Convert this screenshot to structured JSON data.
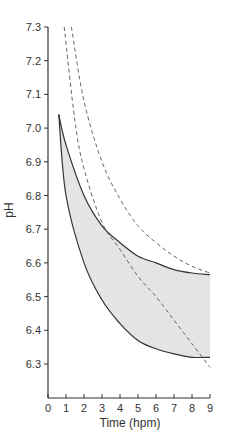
{
  "chart_data": {
    "type": "line",
    "title": "",
    "xlabel": "Time (hpm)",
    "ylabel": "pH",
    "xlim": [
      0,
      9
    ],
    "ylim": [
      6.2,
      7.3
    ],
    "grid": false,
    "legend": null,
    "x_ticks": [
      "0",
      "1",
      "2",
      "3",
      "4",
      "5",
      "6",
      "7",
      "8",
      "9"
    ],
    "y_ticks": [
      "7.3",
      "7.2",
      "7.1",
      "7.0",
      "6.9",
      "6.8",
      "6.7",
      "6.6",
      "6.5",
      "6.4",
      "6.3"
    ],
    "shaded_region": {
      "description": "Grey band bounded by upper and lower solid curves",
      "fill": "#e4e4e4",
      "x_start": 0.6,
      "x_end": 9
    },
    "series": [
      {
        "name": "upper bound (solid)",
        "style": "solid",
        "color": "#333333",
        "x": [
          0.6,
          1,
          2,
          3,
          4,
          5,
          6,
          7,
          8,
          9
        ],
        "values": [
          7.04,
          6.95,
          6.8,
          6.71,
          6.66,
          6.62,
          6.6,
          6.58,
          6.57,
          6.565
        ]
      },
      {
        "name": "lower bound (solid)",
        "style": "solid",
        "color": "#333333",
        "x": [
          0.6,
          1,
          2,
          3,
          4,
          5,
          6,
          7,
          8,
          9
        ],
        "values": [
          7.04,
          6.8,
          6.6,
          6.49,
          6.42,
          6.37,
          6.345,
          6.33,
          6.32,
          6.32
        ]
      },
      {
        "name": "dashed curve A",
        "style": "dashed",
        "color": "#555555",
        "x": [
          0.9,
          1.5,
          2,
          3,
          4,
          5,
          6,
          7,
          8,
          9
        ],
        "values": [
          7.3,
          7.02,
          6.88,
          6.72,
          6.64,
          6.56,
          6.5,
          6.43,
          6.36,
          6.29
        ]
      },
      {
        "name": "dashed curve B",
        "style": "dashed",
        "color": "#555555",
        "x": [
          1.3,
          2,
          3,
          4,
          5,
          6,
          7,
          8,
          9
        ],
        "values": [
          7.3,
          7.08,
          6.9,
          6.79,
          6.71,
          6.66,
          6.62,
          6.59,
          6.57
        ]
      }
    ]
  }
}
